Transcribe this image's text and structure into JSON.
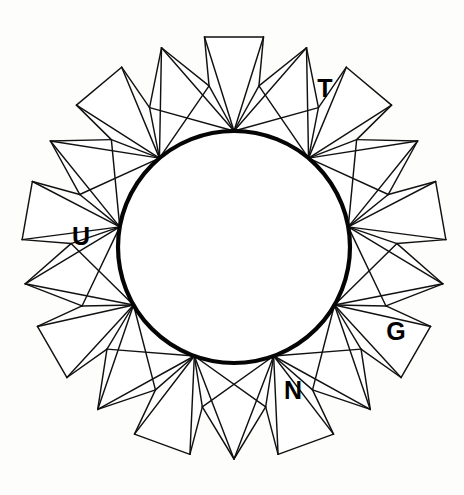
{
  "figure": {
    "kind": "geometric-diagram",
    "background_color": "#fdfdfb",
    "line_color": "#111111",
    "circle_stroke_color": "#050505",
    "face_fill_color": "#ffffff"
  },
  "geometry": {
    "symmetry_order": 9,
    "center": {
      "x": 234,
      "y": 247
    },
    "circle_radius": 116,
    "circle_stroke_width": 4.2,
    "polygon_inner_radius": 116,
    "polygon_mid_radius": 163,
    "polygon_outer_radius": 212,
    "rotation_offset_deg": -90,
    "line_width": 1.45
  },
  "labels": [
    {
      "id": "label-t",
      "text": "T",
      "x": 325,
      "y": 88
    },
    {
      "id": "label-u",
      "text": "U",
      "x": 81,
      "y": 236
    },
    {
      "id": "label-g",
      "text": "G",
      "x": 396,
      "y": 331
    },
    {
      "id": "label-n",
      "text": "N",
      "x": 293,
      "y": 390
    }
  ],
  "label_values": {
    "t": "T",
    "u": "U",
    "g": "G",
    "n": "N"
  }
}
